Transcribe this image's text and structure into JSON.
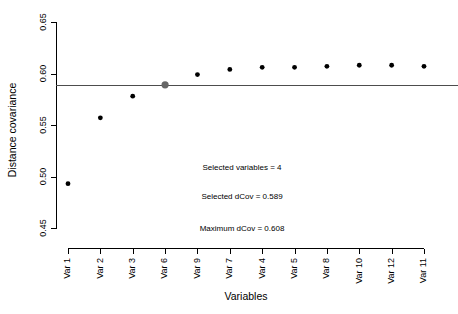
{
  "chart_data": {
    "type": "scatter",
    "title": "",
    "xlabel": "Variables",
    "ylabel": "Distance covariance",
    "categories": [
      "Var 1",
      "Var 2",
      "Var 3",
      "Var 6",
      "Var 9",
      "Var 7",
      "Var 4",
      "Var 5",
      "Var 8",
      "Var 10",
      "Var 12",
      "Var 11"
    ],
    "values": [
      0.493,
      0.557,
      0.578,
      0.589,
      0.599,
      0.604,
      0.606,
      0.606,
      0.607,
      0.608,
      0.608,
      0.607
    ],
    "ylim": [
      0.45,
      0.65
    ],
    "yticks": [
      0.45,
      0.5,
      0.55,
      0.6,
      0.65
    ],
    "ytick_labels": [
      "0.45",
      "0.50",
      "0.55",
      "0.60",
      "0.65"
    ],
    "grid": false,
    "legend": "none",
    "reference_line": {
      "value": 0.589,
      "orientation": "horizontal",
      "color": "#4d4d4d"
    },
    "highlight": {
      "index": 3,
      "category": "Var 6",
      "value": 0.589,
      "color": "#666666"
    },
    "point_color": "#000000",
    "annotations": [
      "Selected variables =  4",
      "Selected dCov =  0.589",
      "Maximum dCov =  0.608"
    ]
  }
}
